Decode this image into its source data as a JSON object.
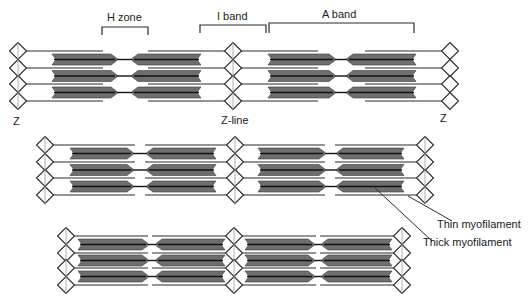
{
  "colors": {
    "line": "#2a2a2a",
    "thick_fill": "#6e6e6e",
    "thick_core": "#111111",
    "zline": "#9a9a9a",
    "background": "#ffffff"
  },
  "labels": {
    "h_zone": "H zone",
    "i_band": "I band",
    "a_band": "A band",
    "z_left": "Z",
    "z_line": "Z-line",
    "z_right": "Z",
    "thin": "Thin myofilament",
    "thick": "Thick myofilament"
  },
  "label_positions": {
    "h_zone": [
      107,
      12
    ],
    "i_band": [
      217,
      11
    ],
    "a_band": [
      322,
      9
    ],
    "z_left": [
      13,
      116
    ],
    "z_line": [
      221,
      115
    ],
    "z_right": [
      440,
      113
    ],
    "thin": [
      437,
      219
    ],
    "thick": [
      423,
      237
    ]
  },
  "brackets": [
    {
      "name": "h-zone-bracket",
      "x1": 102,
      "x2": 148,
      "y": 27,
      "drop": 8
    },
    {
      "name": "i-band-bracket",
      "x1": 200,
      "x2": 266,
      "y": 25,
      "drop": 8
    },
    {
      "name": "a-band-bracket",
      "x1": 269,
      "x2": 414,
      "y": 23,
      "drop": 10
    }
  ],
  "leaders": [
    {
      "name": "thin-leader",
      "x1": 408,
      "y1": 196,
      "x2": 452,
      "y2": 221
    },
    {
      "name": "thick-leader",
      "x1": 375,
      "y1": 188,
      "x2": 432,
      "y2": 241
    }
  ],
  "sarcomere_rows": [
    {
      "name": "relaxed",
      "z": [
        18,
        233,
        450
      ],
      "y": [
        51,
        68,
        84,
        101
      ],
      "thin_len": 85,
      "thick_half": [
        [
          52,
          117
        ],
        [
          132,
          201
        ]
      ],
      "thick_half_right": [
        [
          268,
          335
        ],
        [
          347,
          416
        ]
      ],
      "zline_vertical": [
        true,
        true,
        false
      ]
    },
    {
      "name": "partially-contracted",
      "z": [
        45,
        235,
        425
      ],
      "y": [
        145,
        162,
        178,
        195
      ],
      "thin_len": 90,
      "thick_half": [
        [
          70,
          133
        ],
        [
          147,
          216
        ]
      ],
      "thick_half_right": [
        [
          258,
          325
        ],
        [
          337,
          404
        ]
      ],
      "zline_vertical": [
        true,
        true,
        true
      ]
    },
    {
      "name": "fully-contracted",
      "z": [
        66,
        234,
        402
      ],
      "y": [
        236,
        253,
        268,
        285
      ],
      "thin_len": 82,
      "thick_half": [
        [
          78,
          148
        ],
        [
          156,
          225
        ]
      ],
      "thick_half_right": [
        [
          245,
          314
        ],
        [
          322,
          392
        ]
      ],
      "zline_vertical": [
        true,
        true,
        true
      ]
    }
  ]
}
